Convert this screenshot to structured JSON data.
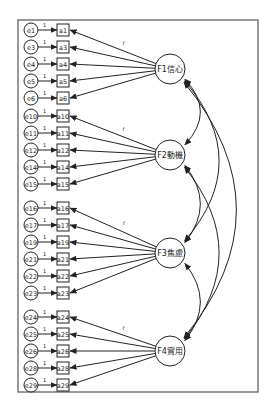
{
  "diagram": {
    "type": "cfa-path-diagram",
    "line_color": "#222222",
    "border_color": "#777777",
    "fixed_loading_label": "1",
    "factor_loading_marker": "f",
    "factors": [
      {
        "id": "F1",
        "label": "F1信心",
        "indicators": [
          {
            "error": "e1",
            "item": "a1"
          },
          {
            "error": "e3",
            "item": "a3"
          },
          {
            "error": "e4",
            "item": "a4"
          },
          {
            "error": "e5",
            "item": "a5"
          },
          {
            "error": "e6",
            "item": "a6"
          }
        ]
      },
      {
        "id": "F2",
        "label": "F2動機",
        "indicators": [
          {
            "error": "e10",
            "item": "a10"
          },
          {
            "error": "e11",
            "item": "a11"
          },
          {
            "error": "e12",
            "item": "a12"
          },
          {
            "error": "e14",
            "item": "a14"
          },
          {
            "error": "e15",
            "item": "a15"
          }
        ]
      },
      {
        "id": "F3",
        "label": "F3焦慮",
        "indicators": [
          {
            "error": "e16",
            "item": "a16"
          },
          {
            "error": "e17",
            "item": "a17"
          },
          {
            "error": "e19",
            "item": "a19"
          },
          {
            "error": "e21",
            "item": "a21"
          },
          {
            "error": "e22",
            "item": "a22"
          },
          {
            "error": "e23",
            "item": "a23"
          }
        ]
      },
      {
        "id": "F4",
        "label": "F4實用",
        "indicators": [
          {
            "error": "e24",
            "item": "a24"
          },
          {
            "error": "e25",
            "item": "a25"
          },
          {
            "error": "e26",
            "item": "a26"
          },
          {
            "error": "e28",
            "item": "a28"
          },
          {
            "error": "e29",
            "item": "a29"
          }
        ]
      }
    ],
    "covariances": [
      [
        "F1",
        "F2"
      ],
      [
        "F2",
        "F3"
      ],
      [
        "F3",
        "F4"
      ],
      [
        "F1",
        "F3"
      ],
      [
        "F2",
        "F4"
      ],
      [
        "F1",
        "F4"
      ]
    ]
  }
}
